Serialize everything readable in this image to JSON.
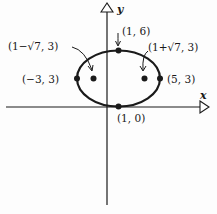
{
  "diagram": {
    "type": "ellipse-graph",
    "axes": {
      "x_label": "x",
      "y_label": "y"
    },
    "ellipse": {
      "center": "(1, 3)",
      "vertices": [
        "(-3, 3)",
        "(5, 3)"
      ],
      "co_vertices": [
        "(1, 6)",
        "(1, 0)"
      ],
      "foci": [
        "(1-√7, 3)",
        "(1+√7, 3)"
      ]
    },
    "labels": {
      "top": "(1, 6)",
      "focus_left": "(1−√7, 3)",
      "focus_right": "(1+√7, 3)",
      "vertex_left": "(−3, 3)",
      "vertex_right": "(5, 3)",
      "bottom": "(1, 0)"
    },
    "colors": {
      "stroke": "#1a1a1a",
      "background": "#fdfdfd"
    }
  }
}
